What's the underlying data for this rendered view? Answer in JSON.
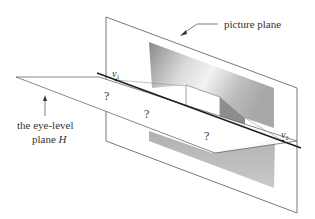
{
  "labels": {
    "picture_plane": "picture plane",
    "eye_level_line1": "the eye-level",
    "eye_level_line2": "plane ",
    "eye_level_symbol": "H",
    "v1_base": "v",
    "v1_sub": "1",
    "v2_base": "v",
    "v2_sub": "2",
    "q1": "?",
    "q2": "?",
    "q3": "?"
  },
  "colors": {
    "line": "#444444",
    "horizon": "#222222",
    "shade_dark": "#9a9a9a",
    "shade_light": "#c8c8c8",
    "ground": "#bdbdbd"
  }
}
